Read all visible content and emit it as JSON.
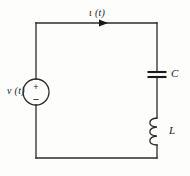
{
  "figure": {
    "kind": "circuit-schematic",
    "background_color": "#fdfdfc",
    "line_color": "#2b2b2b"
  },
  "labels": {
    "current": "ι (t)",
    "voltage_source": "v (t)",
    "capacitor": "C",
    "inductor": "L",
    "polarity_plus": "+",
    "polarity_minus": "−"
  },
  "components": [
    {
      "id": "voltage-source",
      "type": "independent-voltage-source",
      "symbol": "circle-with-plus-minus",
      "label": "v (t)",
      "center_x": 36,
      "center_y": 92,
      "radius": 13,
      "branch": "left"
    },
    {
      "id": "capacitor",
      "type": "capacitor",
      "symbol": "two-parallel-plates",
      "label": "C",
      "center_x": 157,
      "center_y": 75,
      "plate_width": 19,
      "plate_gap": 5,
      "branch": "right"
    },
    {
      "id": "inductor",
      "type": "inductor",
      "symbol": "coil-three-loops",
      "label": "L",
      "center_x": 157,
      "center_y": 131,
      "loops": 3,
      "span": 27,
      "branch": "right"
    }
  ],
  "wires": {
    "loop_left": 36,
    "loop_right": 157,
    "loop_top": 23,
    "loop_bottom": 158
  },
  "current_arrow": {
    "direction": "right",
    "x": 105,
    "y": 23,
    "label": "ι (t)"
  }
}
